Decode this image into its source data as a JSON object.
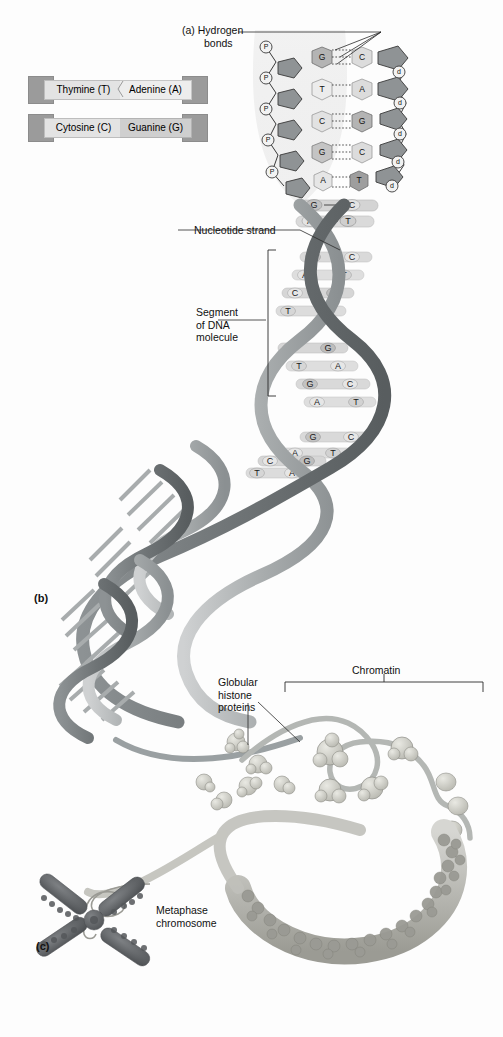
{
  "figure": {
    "panels": [
      {
        "tag": "(a)",
        "name": "hydrogen-bonds-detail"
      },
      {
        "tag": "(b)",
        "name": "dna-double-helix"
      },
      {
        "tag": "(c)",
        "name": "metaphase-chromosome"
      }
    ]
  },
  "labels": {
    "hydrogen_bonds_tag": "(a)",
    "hydrogen_bonds_line1": "Hydrogen",
    "hydrogen_bonds_line2": "bonds",
    "nucleotide_strand": "Nucleotide strand",
    "segment_line1": "Segment",
    "segment_line2": "of DNA",
    "segment_line3": "molecule",
    "panel_b_tag": "(b)",
    "histone_line1": "Globular",
    "histone_line2": "histone",
    "histone_line3": "proteins",
    "chromatin": "Chromatin",
    "metaphase_line1": "Metaphase",
    "metaphase_line2": "chromosome",
    "panel_c_tag": "(c)"
  },
  "legend": {
    "pairs": [
      {
        "left": "Thymine (T)",
        "left_base": "T",
        "right": "Adenine (A)",
        "right_base": "A",
        "bond_count": 2,
        "right_shade": "light"
      },
      {
        "left": "Cytosine (C)",
        "left_base": "C",
        "right": "Guanine (G)",
        "right_base": "G",
        "bond_count": 3,
        "right_shade": "dark"
      }
    ]
  },
  "detail_helix": {
    "phosphate_symbol": "P",
    "deoxyribose_symbol": "d",
    "phosphate_count": 5,
    "deoxyribose_count": 5,
    "base_pairs": [
      {
        "left": "G",
        "right": "C",
        "bonds": 3
      },
      {
        "left": "T",
        "right": "A",
        "bonds": 2
      },
      {
        "left": "C",
        "right": "G",
        "bonds": 3
      },
      {
        "left": "G",
        "right": "C",
        "bonds": 3
      },
      {
        "left": "A",
        "right": "T",
        "bonds": 2
      }
    ]
  },
  "ladder_rungs": {
    "upper": [
      {
        "left": "G",
        "right": "C",
        "bonds": 3
      },
      {
        "left": "A",
        "right": "T",
        "bonds": 2
      }
    ],
    "segment": [
      {
        "left": "G",
        "right": "C",
        "bonds": 3
      },
      {
        "left": "A",
        "right": "T",
        "bonds": 2
      },
      {
        "left": "C",
        "right": "G",
        "bonds": 3
      },
      {
        "left": "T",
        "right": "A",
        "bonds": 2
      },
      {
        "left": "C",
        "right": "G",
        "bonds": 3
      },
      {
        "left": "T",
        "right": "A",
        "bonds": 2
      },
      {
        "left": "G",
        "right": "C",
        "bonds": 3
      },
      {
        "left": "A",
        "right": "T",
        "bonds": 2
      }
    ],
    "lower": [
      {
        "left": "G",
        "right": "C",
        "bonds": 3
      },
      {
        "left": "A",
        "right": "T",
        "bonds": 2
      },
      {
        "left": "C",
        "right": "G",
        "bonds": 3
      },
      {
        "left": "T",
        "right": "A",
        "bonds": 2
      }
    ]
  },
  "colors": {
    "background": "#fdfdfd",
    "ribbon_light": "#b9bcbd",
    "ribbon_dark": "#7e8385",
    "ribbon_edge": "#6a6f71",
    "rung": "#d8d9da",
    "base_chip_light": "#e6e6e6",
    "base_chip_mid": "#cdcdcd",
    "base_chip_dark": "#b4b4b4",
    "sugar_fill": "#8f9395",
    "histone": "#c9c9c4",
    "histone_edge": "#8e8e88",
    "chromosome": "#5f6163",
    "text": "#111111",
    "leader": "#2a2a2a"
  }
}
